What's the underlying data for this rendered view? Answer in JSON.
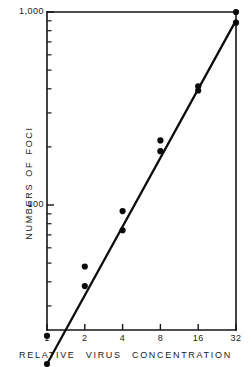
{
  "chart_data": {
    "type": "scatter",
    "title": "",
    "xlabel": "RELATIVE VIRUS CONCENTRATION",
    "ylabel": "NUMBERS OF FOCI",
    "xscale": "log2",
    "yscale": "log10",
    "xlim": [
      1,
      32
    ],
    "ylim": [
      10,
      1000
    ],
    "grid": false,
    "legend": null,
    "x_tick_labels": [
      "1",
      "2",
      "4",
      "8",
      "16",
      "32"
    ],
    "x_tick_values": [
      1,
      2,
      4,
      8,
      16,
      32
    ],
    "y_tick_labels": [
      "1,000",
      "100"
    ],
    "y_tick_values": [
      1000,
      100
    ],
    "y_minor_ticks": [
      900,
      800,
      700,
      600,
      500,
      400,
      300,
      200,
      90,
      80,
      70,
      60,
      50,
      40,
      30,
      20
    ],
    "points": [
      {
        "x": 1,
        "y": 21
      },
      {
        "x": 1,
        "y": 15
      },
      {
        "x": 2,
        "y": 48
      },
      {
        "x": 2,
        "y": 38
      },
      {
        "x": 4,
        "y": 93
      },
      {
        "x": 4,
        "y": 74
      },
      {
        "x": 8,
        "y": 216
      },
      {
        "x": 8,
        "y": 190
      },
      {
        "x": 16,
        "y": 412
      },
      {
        "x": 16,
        "y": 392
      },
      {
        "x": 32,
        "y": 1000
      },
      {
        "x": 32,
        "y": 880
      }
    ],
    "fit_line": {
      "label": "regression line",
      "x_start": 1,
      "y_start": 15,
      "x_end": 32,
      "y_end": 905
    },
    "marker": {
      "shape": "circle",
      "radius_px": 3.1,
      "color": "#0a0a0a"
    },
    "line_color": "#0d0d0d",
    "axis_color": "#141414",
    "background_color": "#ffffff"
  },
  "axes": {
    "y_title": "NUMBERS OF FOCI",
    "x_title": "RELATIVE VIRUS CONCENTRATION"
  }
}
